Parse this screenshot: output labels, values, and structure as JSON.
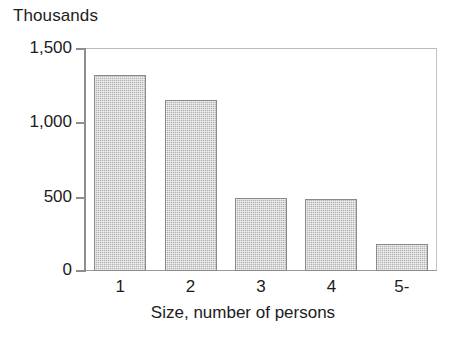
{
  "chart_data": {
    "type": "bar",
    "title": "",
    "subtitle": "",
    "unit_caption": "Thousands",
    "categories": [
      "1",
      "2",
      "3",
      "4",
      "5-"
    ],
    "values": [
      1320,
      1150,
      490,
      485,
      180
    ],
    "xlabel": "Size, number of persons",
    "ylabel": "",
    "ylim": [
      0,
      1500
    ],
    "yticks": [
      0,
      500,
      1000,
      1500
    ],
    "ytick_labels": [
      "0",
      "500",
      "1,000",
      "1,500"
    ],
    "grid": false,
    "legend": null,
    "series": [
      {
        "name": "Households",
        "values": [
          1320,
          1150,
          490,
          485,
          180
        ]
      }
    ],
    "colors": {
      "bar_fill": "#b4b4b4",
      "bar_edge": "#8a8a8a",
      "axis": "#8e8e8e",
      "frame": "#bdbdbd",
      "text": "#1c1c1c",
      "background": "#ffffff"
    }
  }
}
